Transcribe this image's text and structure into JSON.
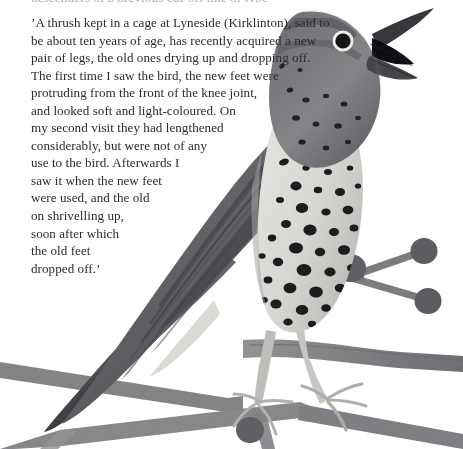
{
  "page": {
    "background_color": "#ffffff",
    "width": 463,
    "height": 449
  },
  "clipped_top_line": {
    "text": "descenders of a previous cut-off line of type"
  },
  "quote": {
    "text_color": "#2b2b30",
    "lines": [
      "’A thrush kept in a cage at Lyneside (Kirklinton), said to",
      "be about ten years of age, has recently acquired a new",
      "pair of legs, the old ones drying up and dropping off.",
      "The first time I saw the bird, the new feet were",
      "protruding from the front of the knee joint,",
      "and looked soft and light-coloured. On",
      "my second visit they had lengthened",
      "considerably, but were not of any",
      "use to the bird. Afterwards I",
      "saw it when the new feet",
      "were used, and the old",
      "on shrivelling up,",
      "soon after which",
      "the old feet",
      "dropped off.’"
    ]
  },
  "illustration": {
    "name": "song-thrush-on-branch",
    "subject": "song thrush perched on a bare branch with buds, beak open singing",
    "style": "greyscale watercolour / painted collage",
    "palette": {
      "back_dark": "#5d5d5f",
      "back_mid": "#76767a",
      "back_light": "#8e8e92",
      "breast_light": "#dcdcd9",
      "breast_shadow": "#c3c3c0",
      "speckle": "#1d1d20",
      "beak_dark": "#3a3a3e",
      "mouth_black": "#121214",
      "eye_ring": "#f2f2f0",
      "branch_mid": "#8b8b8d",
      "branch_dark": "#6e6e72",
      "bud_dark": "#5f5f63",
      "foot_light": "#bdbdba"
    }
  }
}
